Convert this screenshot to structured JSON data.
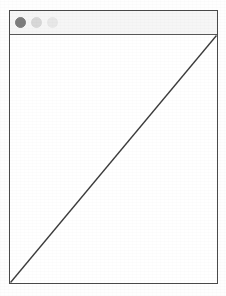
{
  "window": {
    "title": "",
    "frame": {
      "border_color": "#4a4a4a",
      "background": "#ffffff"
    },
    "titlebar": {
      "background": "#f6f6f6",
      "divider_color": "#5a5a5a",
      "controls": [
        {
          "name": "close",
          "icon": "circle-icon",
          "color": "#7d7d7d",
          "label": ""
        },
        {
          "name": "minimize",
          "icon": "circle-icon",
          "color": "#d8d8d8",
          "label": ""
        },
        {
          "name": "maximize",
          "icon": "circle-icon",
          "color": "#e8e8e8",
          "label": ""
        }
      ]
    },
    "content": {
      "background": "#ffffff",
      "shapes": [
        {
          "type": "line",
          "name": "diagonal-line",
          "from": "bottom-left",
          "to": "top-right",
          "color": "#3c3c3c",
          "stroke_width": 1.4
        }
      ]
    }
  }
}
